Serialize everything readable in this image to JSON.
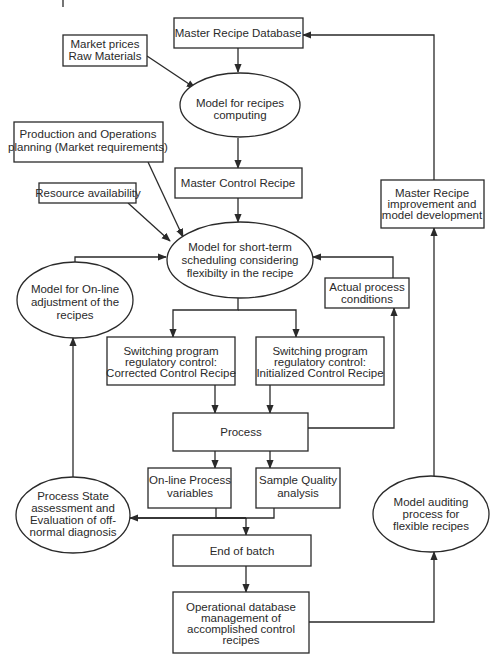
{
  "diagram": {
    "type": "flowchart",
    "nodes": {
      "master_recipe_db": {
        "lines": [
          "Master Recipe Database"
        ]
      },
      "market_prices": {
        "lines": [
          "Market prices",
          "Raw Materials"
        ]
      },
      "recipes_computing": {
        "lines": [
          "Model for recipes",
          "computing"
        ]
      },
      "production_planning": {
        "lines": [
          "Production and Operations",
          "planning (Market requirements)"
        ]
      },
      "master_control_recipe": {
        "lines": [
          "Master Control Recipe"
        ]
      },
      "resource_availability": {
        "lines": [
          "Resource availability"
        ]
      },
      "short_term_scheduling": {
        "lines": [
          "Model for short-term",
          "scheduling considering",
          "flexibilty in the recipe"
        ]
      },
      "online_adjustment": {
        "lines": [
          "Model for On-line",
          "adjustment of the",
          "recipes"
        ]
      },
      "actual_conditions": {
        "lines": [
          "Actual process",
          "conditions"
        ]
      },
      "recipe_improvement": {
        "lines": [
          "Master Recipe",
          "improvement and",
          "model development"
        ]
      },
      "switching_corrected": {
        "lines": [
          "Switching program",
          "regulatory control:",
          "Corrected Control Recipe"
        ]
      },
      "switching_initialized": {
        "lines": [
          "Switching program",
          "regulatory control:",
          "Initialized Control Recipe"
        ]
      },
      "process": {
        "lines": [
          "Process"
        ]
      },
      "online_variables": {
        "lines": [
          "On-line Process",
          "variables"
        ]
      },
      "sample_quality": {
        "lines": [
          "Sample Quality",
          "analysis"
        ]
      },
      "state_assessment": {
        "lines": [
          "Process State",
          "assessment and",
          "Evaluation of off-",
          "normal diagnosis"
        ]
      },
      "end_of_batch": {
        "lines": [
          "End of batch"
        ]
      },
      "operational_db": {
        "lines": [
          "Operational database",
          "management of",
          "accomplished control",
          "recipes"
        ]
      },
      "model_auditing": {
        "lines": [
          "Model auditing",
          "process for",
          "flexible recipes"
        ]
      }
    },
    "edges": [
      [
        "master_recipe_db",
        "recipes_computing"
      ],
      [
        "market_prices",
        "recipes_computing"
      ],
      [
        "recipes_computing",
        "master_control_recipe"
      ],
      [
        "production_planning",
        "short_term_scheduling"
      ],
      [
        "resource_availability",
        "short_term_scheduling"
      ],
      [
        "master_control_recipe",
        "short_term_scheduling"
      ],
      [
        "online_adjustment",
        "short_term_scheduling"
      ],
      [
        "actual_conditions",
        "short_term_scheduling"
      ],
      [
        "short_term_scheduling",
        "switching_corrected"
      ],
      [
        "short_term_scheduling",
        "switching_initialized"
      ],
      [
        "switching_corrected",
        "process"
      ],
      [
        "switching_initialized",
        "process"
      ],
      [
        "process",
        "actual_conditions"
      ],
      [
        "process",
        "online_variables"
      ],
      [
        "process",
        "sample_quality"
      ],
      [
        "online_variables",
        "state_assessment"
      ],
      [
        "sample_quality",
        "state_assessment"
      ],
      [
        "online_variables",
        "end_of_batch"
      ],
      [
        "sample_quality",
        "end_of_batch"
      ],
      [
        "state_assessment",
        "online_adjustment"
      ],
      [
        "end_of_batch",
        "operational_db"
      ],
      [
        "operational_db",
        "model_auditing"
      ],
      [
        "model_auditing",
        "recipe_improvement"
      ],
      [
        "recipe_improvement",
        "master_recipe_db"
      ]
    ]
  }
}
